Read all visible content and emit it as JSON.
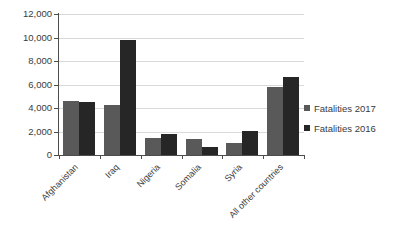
{
  "chart_data": {
    "type": "bar",
    "title": "",
    "subtitle": "",
    "xlabel": "",
    "ylabel": "",
    "categories": [
      "Afghanistan",
      "Iraq",
      "Nigeria",
      "Somalia",
      "Syria",
      "All other countries"
    ],
    "series": [
      {
        "name": "Fatalities 2017",
        "color": "#595959",
        "values": [
          4600,
          4250,
          1480,
          1400,
          1050,
          5750
        ]
      },
      {
        "name": "Fatalities 2016",
        "color": "#262626",
        "values": [
          4550,
          9750,
          1800,
          700,
          2080,
          6600
        ]
      }
    ],
    "ylim": [
      0,
      12000
    ],
    "ytick_values": [
      0,
      2000,
      4000,
      6000,
      8000,
      10000,
      12000
    ],
    "ytick_labels": [
      "0",
      "2,000",
      "4,000",
      "6,000",
      "8,000",
      "10,000",
      "12,000"
    ],
    "grid": true,
    "grid_axis": "y",
    "legend_position": "right",
    "xtick_label_rotation": -45
  },
  "legend": {
    "items": [
      {
        "label": "Fatalities 2017",
        "color": "#595959"
      },
      {
        "label": "Fatalities 2016",
        "color": "#262626"
      }
    ]
  },
  "colors": {
    "series_2017": "#595959",
    "series_2016": "#262626",
    "gridline": "#d9d9d9",
    "axis": "#4d4d4d",
    "text": "#3a3a3a",
    "background": "#ffffff"
  }
}
